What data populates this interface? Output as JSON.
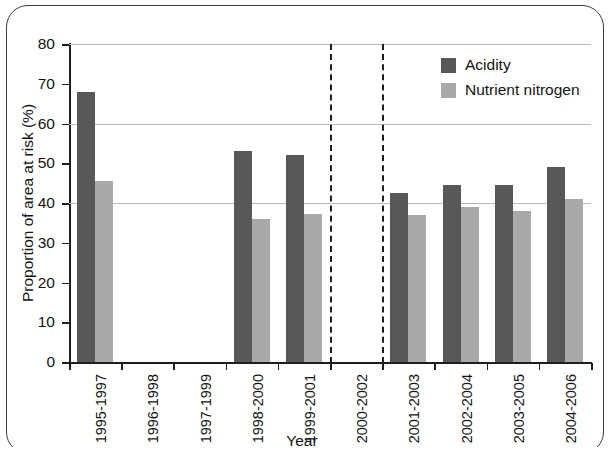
{
  "chart_data": {
    "type": "bar",
    "title": "",
    "xlabel": "Year",
    "ylabel": "Proportion of area at risk (%)",
    "ylim": [
      0,
      80
    ],
    "ytick_step": 10,
    "yticks": [
      0,
      10,
      20,
      30,
      40,
      50,
      60,
      70,
      80
    ],
    "grid": "horizontal gridlines at 40, 60 and 80",
    "legend_position": "top-right inside plot",
    "categories": [
      "1995-1997",
      "1996-1998",
      "1997-1999",
      "1998-2000",
      "1999-2001",
      "2000-2002",
      "2001-2003",
      "2002-2004",
      "2003-2005",
      "2004-2006"
    ],
    "series": [
      {
        "name": "Acidity",
        "color": "#58585a",
        "values": [
          68,
          null,
          null,
          53,
          52,
          null,
          42.5,
          44.5,
          44.5,
          49
        ]
      },
      {
        "name": "Nutrient nitrogen",
        "color": "#a9a9a9",
        "values": [
          45.5,
          null,
          null,
          36,
          37.2,
          null,
          37,
          39,
          38,
          41
        ]
      }
    ],
    "annotations": [
      {
        "type": "dashed-vertical-line",
        "after_category": "1999-2001",
        "note": "dashed separator before 2000-2002"
      },
      {
        "type": "dashed-vertical-line",
        "after_category": "2000-2002",
        "note": "dashed separator after 2000-2002"
      }
    ],
    "missing_data_categories": [
      "1996-1998",
      "1997-1999",
      "2000-2002"
    ]
  },
  "legend": {
    "items": [
      {
        "label": "Acidity",
        "color": "#58585a"
      },
      {
        "label": "Nutrient nitrogen",
        "color": "#a9a9a9"
      }
    ]
  },
  "axes": {
    "y_title": "Proportion of area at risk (%)",
    "x_title": "Year",
    "y_tick_labels": [
      "80",
      "70",
      "60",
      "50",
      "40",
      "30",
      "20",
      "10",
      "0"
    ]
  }
}
